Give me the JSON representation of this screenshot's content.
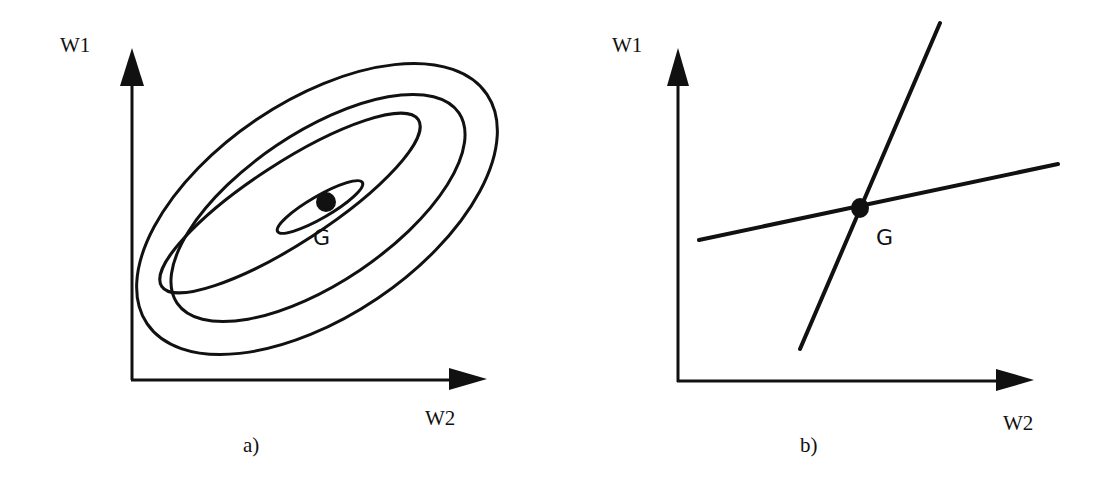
{
  "figure": {
    "panels": [
      {
        "id": "a",
        "caption": "a)",
        "y_axis_label": "W1",
        "x_axis_label": "W2",
        "point_label": "G",
        "description": "Concentric elliptical error contours centered on minimum G"
      },
      {
        "id": "b",
        "caption": "b)",
        "y_axis_label": "W1",
        "x_axis_label": "W2",
        "point_label": "G",
        "description": "Two intersecting lines crossing at point G"
      }
    ],
    "colors": {
      "ink": "#111111",
      "background": "#ffffff"
    }
  }
}
